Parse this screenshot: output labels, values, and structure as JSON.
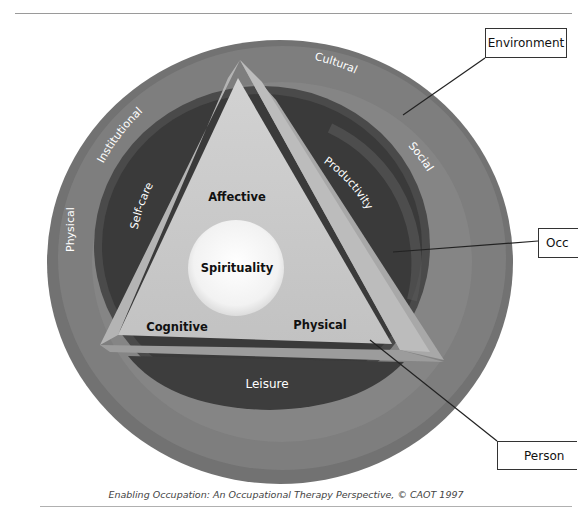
{
  "figure": {
    "caption": "Enabling Occupation:  An Occupational Therapy Perspective, © CAOT 1997",
    "colors": {
      "outer_ring": "#7c7c7c",
      "middle_ring": "#6a6a6a",
      "occupation_ring": "#3a3a3a",
      "triangle_face": "#c8c8c8",
      "triangle_edge": "#a4a4a4",
      "spirit_circle": "#f4f4f4"
    }
  },
  "callouts": {
    "environment": "Environment",
    "occupation": "Occ",
    "person": "Person"
  },
  "environment_ring": {
    "physical": "Physical",
    "institutional": "Institutional",
    "cultural": "Cultural",
    "social": "Social"
  },
  "occupation_ring": {
    "self_care": "Self-care",
    "productivity": "Productivity",
    "leisure": "Leisure"
  },
  "person_triangle": {
    "affective": "Affective",
    "cognitive": "Cognitive",
    "physical": "Physical",
    "spirituality": "Spirituality"
  }
}
